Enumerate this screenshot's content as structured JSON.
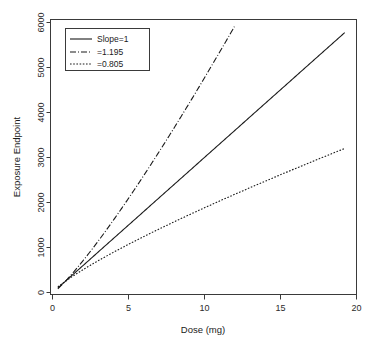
{
  "chart_data": {
    "type": "line",
    "title": "",
    "subtitle": "",
    "xlabel": "Dose (mg)",
    "ylabel": "Exposure Endpoint",
    "xlim": [
      0,
      20.8
    ],
    "ylim": [
      0,
      6300
    ],
    "x_ticks": [
      0,
      5,
      10,
      15,
      20
    ],
    "x_tick_labels": [
      "0",
      "5",
      "10",
      "15",
      "20"
    ],
    "y_ticks": [
      0,
      1000,
      2000,
      3000,
      4000,
      5000,
      6000
    ],
    "y_tick_labels": [
      "0",
      "1000",
      "2000",
      "3000",
      "4000",
      "5000",
      "6000"
    ],
    "grid": false,
    "legend_position": "top-left",
    "x_domain": [
      0.5,
      20
    ],
    "model": "power: y = 300 * x^slope",
    "series": [
      {
        "name": "Slope=1",
        "slope": 1,
        "style": "solid",
        "x": [
          0.5,
          1,
          2,
          3,
          4,
          5,
          6,
          7,
          8,
          9,
          10,
          11,
          12,
          13,
          14,
          15,
          16,
          17,
          18,
          19,
          20
        ],
        "values": [
          150,
          300,
          600,
          900,
          1200,
          1500,
          1800,
          2100,
          2400,
          2700,
          3000,
          3300,
          3600,
          3900,
          4200,
          4500,
          4800,
          5100,
          5400,
          5700,
          6000
        ]
      },
      {
        "name": "=1.195",
        "slope": 1.195,
        "style": "dashdot",
        "x": [
          0.5,
          1,
          2,
          3,
          4,
          5,
          6,
          7,
          8,
          9,
          10,
          11,
          12,
          12.5
        ],
        "values": [
          131,
          300,
          687,
          1106,
          1573,
          2078,
          2615,
          3180,
          3770,
          4384,
          5018,
          5673,
          6346,
          6690
        ]
      },
      {
        "name": "=0.805",
        "slope": 0.805,
        "style": "dotted",
        "x": [
          0.5,
          1,
          2,
          3,
          4,
          5,
          6,
          7,
          8,
          9,
          10,
          11,
          12,
          13,
          14,
          15,
          16,
          17,
          18,
          19,
          20
        ],
        "values": [
          172,
          300,
          524,
          726,
          916,
          1097,
          1271,
          1440,
          1604,
          1765,
          1922,
          2076,
          2228,
          2377,
          2524,
          2669,
          2812,
          2954,
          3094,
          3232,
          3369
        ]
      }
    ]
  },
  "legend": {
    "entries": [
      {
        "label": "Slope=1",
        "style": "solid"
      },
      {
        "label": "=1.195",
        "style": "dashdot"
      },
      {
        "label": "=0.805",
        "style": "dotted"
      }
    ]
  },
  "axes": {
    "x_title": "Dose (mg)",
    "y_title": "Exposure Endpoint",
    "x_labels": [
      "0",
      "5",
      "10",
      "15",
      "20"
    ],
    "y_labels": [
      "0",
      "1000",
      "2000",
      "3000",
      "4000",
      "5000",
      "6000"
    ]
  },
  "colors": {
    "background": "#ffffff",
    "line": "#1a1a1a",
    "axis": "#3a3a3a",
    "text": "#1a1a1a"
  }
}
